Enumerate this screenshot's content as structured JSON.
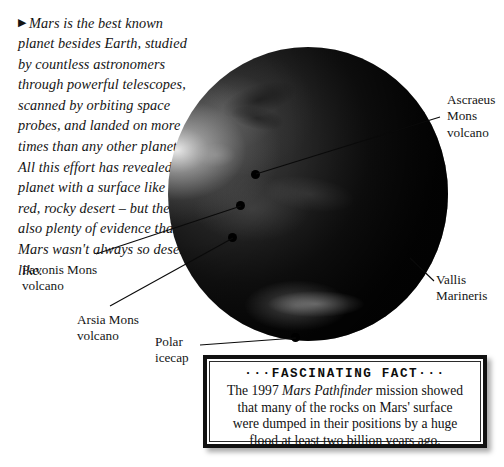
{
  "intro": {
    "bullet": "▶",
    "text": "Mars is the best known planet besides Earth, studied by countless astronomers through powerful telescopes, scanned by orbiting space probes, and landed on more times than any other planet. All this effort has revealed a planet with a surface like a red, rocky desert – but there is also plenty of evidence that Mars wasn't always so desert-like."
  },
  "planet": {
    "name": "Mars",
    "body_color": "#0b0b0b",
    "highlight_color": "#e8e8e8"
  },
  "callouts": [
    {
      "id": "ascraeus",
      "line1": "Ascraeus",
      "line2": "Mons",
      "line3": "volcano"
    },
    {
      "id": "vallis",
      "line1": "Vallis",
      "line2": "Marineris",
      "line3": ""
    },
    {
      "id": "pavonis",
      "line1": "Pavonis Mons",
      "line2": "volcano",
      "line3": ""
    },
    {
      "id": "arsia",
      "line1": "Arsia Mons",
      "line2": "volcano",
      "line3": ""
    },
    {
      "id": "polar",
      "line1": "Polar",
      "line2": "icecap",
      "line3": ""
    }
  ],
  "fact_box": {
    "heading": "···FASCINATING FACT···",
    "line1_pre": "The 1997 ",
    "line1_italic": "Mars Pathfinder",
    "line1_post": " mission showed",
    "line2": "that many of the rocks on Mars' surface",
    "line3": "were dumped in their positions by a huge",
    "line4": "flood at least two billion years ago."
  }
}
